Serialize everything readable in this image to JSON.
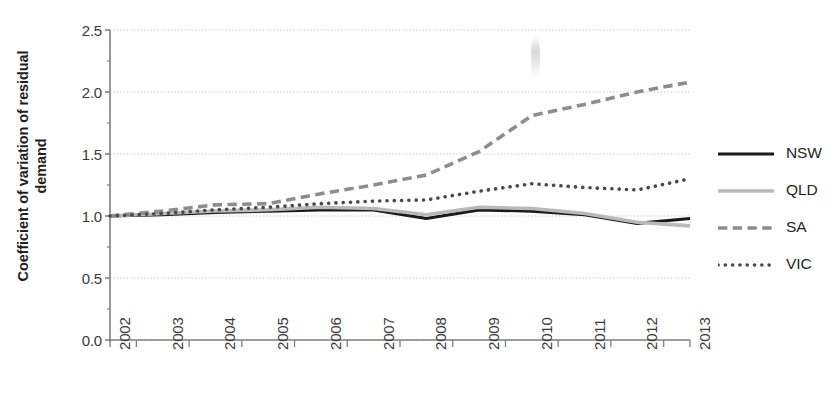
{
  "figure": {
    "plot_area": {
      "left": 110,
      "top": 30,
      "right": 690,
      "bottom": 340
    },
    "ylabel_text": "Coefficient of variation of residual\ndemand",
    "colors": {
      "nsw": "#1a1a1a",
      "qld": "#b9b9b9",
      "sa": "#8d8d8d",
      "vic": "#4a4a4a",
      "axis": "#808080",
      "grid": "#bfbfbf",
      "text": "#231f20"
    }
  },
  "chart_data": {
    "type": "line",
    "title": "",
    "xlabel": "",
    "ylabel": "Coefficient of variation of residual demand",
    "x": [
      2002,
      2003,
      2004,
      2005,
      2006,
      2007,
      2008,
      2009,
      2010,
      2011,
      2012,
      2013
    ],
    "xtick_labels": [
      "2002",
      "2003",
      "2004",
      "2005",
      "2006",
      "2007",
      "2008",
      "2009",
      "2010",
      "2011",
      "2012",
      "2013"
    ],
    "ytick_labels": [
      "0.0",
      "0.5",
      "1.0",
      "1.5",
      "2.0",
      "2.5"
    ],
    "yticks": [
      0.0,
      0.5,
      1.0,
      1.5,
      2.0,
      2.5
    ],
    "ylim": [
      0.0,
      2.5
    ],
    "xlim": [
      2002,
      2013
    ],
    "grid": true,
    "grid_axis": "y",
    "legend_position": "right",
    "series": [
      {
        "name": "NSW",
        "style": "solid",
        "color": "#1a1a1a",
        "width": 3.2,
        "values": [
          1.0,
          1.01,
          1.03,
          1.04,
          1.05,
          1.05,
          0.98,
          1.05,
          1.04,
          1.01,
          0.94,
          0.98
        ]
      },
      {
        "name": "QLD",
        "style": "solid",
        "color": "#b9b9b9",
        "width": 3.6,
        "values": [
          1.0,
          1.02,
          1.04,
          1.05,
          1.07,
          1.06,
          1.01,
          1.07,
          1.06,
          1.02,
          0.95,
          0.92
        ]
      },
      {
        "name": "SA",
        "style": "dashed",
        "color": "#8d8d8d",
        "width": 3.6,
        "values": [
          1.0,
          1.04,
          1.09,
          1.1,
          1.18,
          1.25,
          1.33,
          1.52,
          1.81,
          1.9,
          2.0,
          2.08
        ]
      },
      {
        "name": "VIC",
        "style": "dotted",
        "color": "#4a4a4a",
        "width": 3.6,
        "values": [
          1.0,
          1.02,
          1.05,
          1.07,
          1.1,
          1.12,
          1.13,
          1.2,
          1.26,
          1.23,
          1.21,
          1.3
        ]
      }
    ]
  },
  "legend": {
    "items": [
      {
        "label": "NSW",
        "style": "solid",
        "color": "#1a1a1a"
      },
      {
        "label": "QLD",
        "style": "solid",
        "color": "#b9b9b9"
      },
      {
        "label": "SA",
        "style": "dashed",
        "color": "#8d8d8d"
      },
      {
        "label": "VIC",
        "style": "dotted",
        "color": "#4a4a4a"
      }
    ]
  }
}
